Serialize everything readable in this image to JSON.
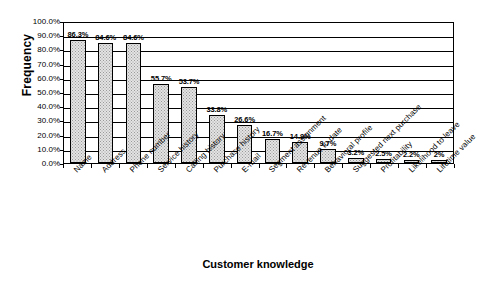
{
  "chart_data": {
    "type": "bar",
    "title": "",
    "xlabel": "Customer knowledge",
    "ylabel": "Frequency",
    "ylim": [
      0,
      100
    ],
    "ytick_labels": [
      "100.0%",
      "90.0%",
      "80.0%",
      "70.0%",
      "60.0%",
      "50.0%",
      "40.0%",
      "30.0%",
      "20.0%",
      "10.0%",
      "0.0%"
    ],
    "ytick_values": [
      100,
      90,
      80,
      70,
      60,
      50,
      40,
      30,
      20,
      10,
      0
    ],
    "grid": true,
    "legend": "none",
    "categories": [
      "Name",
      "Address",
      "Phone number",
      "Service history",
      "Calling history",
      "Purchase history",
      "E-mail",
      "Segment assignment",
      "Revenue to date",
      "Behavioral profile",
      "Suggested next purchase",
      "Profitability",
      "Likelihood to leave",
      "Lifetime value"
    ],
    "values": [
      86.3,
      84.6,
      84.6,
      55.7,
      53.7,
      33.8,
      26.6,
      16.7,
      14.9,
      9.7,
      3.2,
      2.5,
      2.2,
      2.0
    ],
    "data_labels": [
      "86.3%",
      "84.6%",
      "84.6%",
      "55.7%",
      "53.7%",
      "33.8%",
      "26.6%",
      "16.7%",
      "14.9%",
      "9.7%",
      "3.2%",
      "2.5%",
      "2.2%",
      "2%"
    ],
    "colors": {
      "bar_fill": "#e3e3e3",
      "bar_pattern": "#9a9a9a",
      "bar_border": "#000000",
      "axis": "#000000",
      "grid": "#000000",
      "background": "#ffffff",
      "text": "#000000"
    }
  }
}
